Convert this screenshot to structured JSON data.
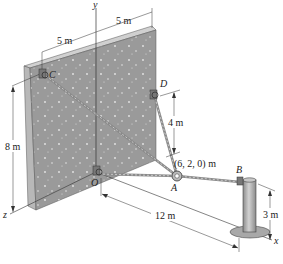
{
  "figure": {
    "points": {
      "C": {
        "label": "C"
      },
      "D": {
        "label": "D"
      },
      "O": {
        "label": "O"
      },
      "A": {
        "label": "A",
        "coordinate_label": "(6, 2, 0) m"
      },
      "B": {
        "label": "B"
      }
    },
    "axes": {
      "x": "x",
      "y": "y",
      "z": "z"
    },
    "dimensions": {
      "top_left": "5 m",
      "top_right": "5 m",
      "height_wall": "8 m",
      "height_D": "4 m",
      "distance_OB": "12 m",
      "height_post": "3 m"
    },
    "colors": {
      "wall_face": "#9a9a9a",
      "wall_side": "#b8b8b8",
      "wall_top": "#d0d0d0",
      "cable": "#8a8a8a",
      "post": "#a8a8a8",
      "line": "#333333"
    }
  }
}
